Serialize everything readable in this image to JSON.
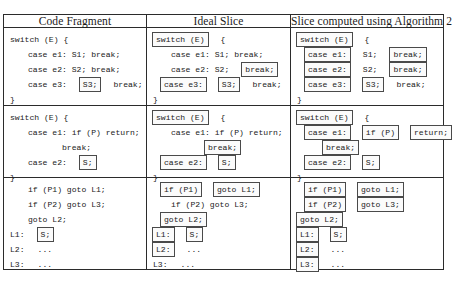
{
  "figure": {
    "kind": "program-slicing-comparison-table",
    "columns": [
      {
        "id": "code-fragment",
        "header": "Code Fragment"
      },
      {
        "id": "ideal-slice",
        "header": "Ideal Slice"
      },
      {
        "id": "algorithm-2-slice",
        "header": "Slice computed using Algorithm 2"
      }
    ],
    "style": {
      "border_color": "#2b2b2b",
      "box_border_color": "#4a4a4a",
      "background": "#ffffff",
      "text_color": "#1a1a1a"
    }
  },
  "examples": [
    {
      "id": "switch-example",
      "code_fragment": {
        "lines": [
          {
            "indent": "i0",
            "tokens": [
              {
                "text": "switch (E) {",
                "boxed": false
              }
            ]
          },
          {
            "indent": "i1",
            "tokens": [
              {
                "text": "case e1: S1; break;",
                "boxed": false
              }
            ]
          },
          {
            "indent": "i1",
            "tokens": [
              {
                "text": "case e2: S2; break;",
                "boxed": false
              }
            ]
          },
          {
            "indent": "i1",
            "tokens": [
              {
                "text": "case e3:",
                "boxed": false
              },
              {
                "text": "S3;",
                "boxed": true
              },
              {
                "text": "break;",
                "boxed": false
              }
            ]
          },
          {
            "indent": "i0",
            "tokens": [
              {
                "text": "}",
                "boxed": false
              }
            ]
          }
        ]
      },
      "ideal_slice": {
        "lines": [
          {
            "indent": "i0",
            "tokens": [
              {
                "text": "switch (E)",
                "boxed": true
              },
              {
                "text": "{",
                "boxed": false
              }
            ]
          },
          {
            "indent": "i1",
            "tokens": [
              {
                "text": "case e1: S1; break;",
                "boxed": false
              }
            ]
          },
          {
            "indent": "i1",
            "tokens": [
              {
                "text": "case e2: S2;",
                "boxed": false
              },
              {
                "text": "break;",
                "boxed": true
              }
            ]
          },
          {
            "indent": "i4",
            "tokens": [
              {
                "text": "case e3:",
                "boxed": true
              },
              {
                "text": "S3;",
                "boxed": true
              },
              {
                "text": "break;",
                "boxed": false
              }
            ]
          },
          {
            "indent": "i0",
            "tokens": [
              {
                "text": "}",
                "boxed": false
              }
            ]
          }
        ]
      },
      "algorithm2_slice": {
        "lines": [
          {
            "indent": "i0",
            "tokens": [
              {
                "text": "switch (E)",
                "boxed": true
              },
              {
                "text": "{",
                "boxed": false
              }
            ]
          },
          {
            "indent": "i4",
            "tokens": [
              {
                "text": "case e1:",
                "boxed": true
              },
              {
                "text": "S1;",
                "boxed": false
              },
              {
                "text": "break;",
                "boxed": true
              }
            ]
          },
          {
            "indent": "i4",
            "tokens": [
              {
                "text": "case e2:",
                "boxed": true
              },
              {
                "text": "S2;",
                "boxed": false
              },
              {
                "text": "break;",
                "boxed": true
              }
            ]
          },
          {
            "indent": "i4",
            "tokens": [
              {
                "text": "case e3:",
                "boxed": true
              },
              {
                "text": "S3;",
                "boxed": true
              },
              {
                "text": "break;",
                "boxed": false
              }
            ]
          },
          {
            "indent": "i0",
            "tokens": [
              {
                "text": "}",
                "boxed": false
              }
            ]
          }
        ]
      }
    },
    {
      "id": "early-return-example",
      "code_fragment": {
        "lines": [
          {
            "indent": "i0",
            "tokens": [
              {
                "text": "switch (E) {",
                "boxed": false
              }
            ]
          },
          {
            "indent": "i1",
            "tokens": [
              {
                "text": "case e1: if (P) return;",
                "boxed": false
              }
            ]
          },
          {
            "indent": "i3",
            "tokens": [
              {
                "text": "break;",
                "boxed": false
              }
            ]
          },
          {
            "indent": "i1",
            "tokens": [
              {
                "text": "case e2:",
                "boxed": false
              },
              {
                "text": "S;",
                "boxed": true
              }
            ]
          },
          {
            "indent": "i0",
            "tokens": [
              {
                "text": "}",
                "boxed": false
              }
            ]
          }
        ]
      },
      "ideal_slice": {
        "lines": [
          {
            "indent": "i0",
            "tokens": [
              {
                "text": "switch (E)",
                "boxed": true
              },
              {
                "text": "{",
                "boxed": false
              }
            ]
          },
          {
            "indent": "i1",
            "tokens": [
              {
                "text": "case e1: if (P) return;",
                "boxed": false
              }
            ]
          },
          {
            "indent": "i3",
            "tokens": [
              {
                "text": "break;",
                "boxed": true
              }
            ]
          },
          {
            "indent": "i4",
            "tokens": [
              {
                "text": "case e2:",
                "boxed": true
              },
              {
                "text": "S;",
                "boxed": true
              }
            ]
          },
          {
            "indent": "i0",
            "tokens": [
              {
                "text": "}",
                "boxed": false
              }
            ]
          }
        ]
      },
      "algorithm2_slice": {
        "lines": [
          {
            "indent": "i0",
            "tokens": [
              {
                "text": "switch (E)",
                "boxed": true
              },
              {
                "text": "{",
                "boxed": false
              }
            ]
          },
          {
            "indent": "i4",
            "tokens": [
              {
                "text": "case e1:",
                "boxed": true
              },
              {
                "text": "if (P)",
                "boxed": true
              },
              {
                "text": "return;",
                "boxed": true
              }
            ]
          },
          {
            "indent": "i2",
            "tokens": [
              {
                "text": "break;",
                "boxed": true
              }
            ]
          },
          {
            "indent": "i4",
            "tokens": [
              {
                "text": "case e2:",
                "boxed": true
              },
              {
                "text": "S;",
                "boxed": true
              }
            ]
          },
          {
            "indent": "i0",
            "tokens": [
              {
                "text": "}",
                "boxed": false
              }
            ]
          }
        ]
      }
    },
    {
      "id": "goto-label-example",
      "code_fragment": {
        "lines": [
          {
            "indent": "i1",
            "tokens": [
              {
                "text": "if (P1) goto L1;",
                "boxed": false
              }
            ]
          },
          {
            "indent": "i1",
            "tokens": [
              {
                "text": "if (P2) goto L3;",
                "boxed": false
              }
            ]
          },
          {
            "indent": "i1",
            "tokens": [
              {
                "text": "goto L2;",
                "boxed": false
              }
            ]
          },
          {
            "indent": "i0",
            "tokens": [
              {
                "text": "L1:",
                "boxed": false
              },
              {
                "text": "S;",
                "boxed": true
              }
            ]
          },
          {
            "indent": "i0",
            "tokens": [
              {
                "text": "L2:",
                "boxed": false
              },
              {
                "text": "...",
                "boxed": false
              }
            ]
          },
          {
            "indent": "i0",
            "tokens": [
              {
                "text": "L3:",
                "boxed": false
              },
              {
                "text": "...",
                "boxed": false
              }
            ]
          }
        ]
      },
      "ideal_slice": {
        "lines": [
          {
            "indent": "i4",
            "tokens": [
              {
                "text": "if (P1)",
                "boxed": true
              },
              {
                "text": "goto L1;",
                "boxed": true
              }
            ]
          },
          {
            "indent": "i1",
            "tokens": [
              {
                "text": "if (P2) goto L3;",
                "boxed": false
              }
            ]
          },
          {
            "indent": "i4",
            "tokens": [
              {
                "text": "goto L2;",
                "boxed": true
              }
            ]
          },
          {
            "indent": "i0",
            "tokens": [
              {
                "text": "L1:",
                "boxed": true
              },
              {
                "text": "S;",
                "boxed": true
              }
            ]
          },
          {
            "indent": "i0",
            "tokens": [
              {
                "text": "L2:",
                "boxed": true
              },
              {
                "text": "...",
                "boxed": false
              }
            ]
          },
          {
            "indent": "i0",
            "tokens": [
              {
                "text": "L3:",
                "boxed": false
              },
              {
                "text": "...",
                "boxed": false
              }
            ]
          }
        ]
      },
      "algorithm2_slice": {
        "lines": [
          {
            "indent": "i4",
            "tokens": [
              {
                "text": "if (P1)",
                "boxed": true
              },
              {
                "text": "goto L1;",
                "boxed": true
              }
            ]
          },
          {
            "indent": "i4",
            "tokens": [
              {
                "text": "if (P2)",
                "boxed": true
              },
              {
                "text": "goto L3;",
                "boxed": true
              }
            ]
          },
          {
            "indent": "i0",
            "tokens": [
              {
                "text": "goto L2;",
                "boxed": true
              }
            ]
          },
          {
            "indent": "i0",
            "tokens": [
              {
                "text": "L1:",
                "boxed": true
              },
              {
                "text": "S;",
                "boxed": true
              }
            ]
          },
          {
            "indent": "i0",
            "tokens": [
              {
                "text": "L2:",
                "boxed": true
              },
              {
                "text": "...",
                "boxed": false
              }
            ]
          },
          {
            "indent": "i0",
            "tokens": [
              {
                "text": "L3:",
                "boxed": true
              },
              {
                "text": "...",
                "boxed": false
              }
            ]
          }
        ]
      }
    }
  ]
}
